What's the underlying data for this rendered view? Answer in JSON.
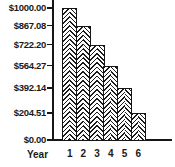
{
  "chart_data": {
    "type": "bar",
    "title": "",
    "xlabel": "Year",
    "ylabel": "",
    "categories": [
      "1",
      "2",
      "3",
      "4",
      "5",
      "6"
    ],
    "values": [
      1000.0,
      867.08,
      722.2,
      564.27,
      392.14,
      204.51
    ],
    "y_ticks": [
      {
        "value": 1000.0,
        "label": "$1000.00"
      },
      {
        "value": 867.08,
        "label": "$867.08"
      },
      {
        "value": 722.2,
        "label": "$722.20"
      },
      {
        "value": 564.27,
        "label": "$564.27"
      },
      {
        "value": 392.14,
        "label": "$392.14"
      },
      {
        "value": 204.51,
        "label": "$204.51"
      },
      {
        "value": 0.0,
        "label": "$0.00"
      }
    ],
    "ylim": [
      0,
      1000
    ],
    "grid": false,
    "legend": "none",
    "bar_fill": "herringbone-hatch",
    "ink_color": "#161616",
    "background_color": "#ffffff"
  }
}
